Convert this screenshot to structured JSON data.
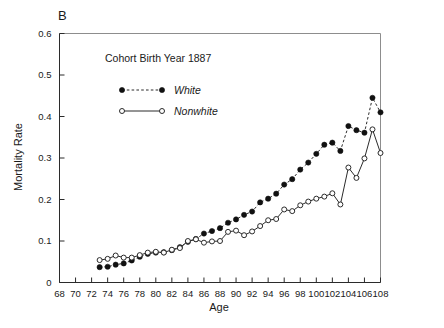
{
  "panel": {
    "label": "B"
  },
  "chart_data": {
    "type": "line",
    "title": "",
    "annotation": "Cohort Birth Year 1887",
    "xlabel": "Age",
    "ylabel": "Mortality Rate",
    "xlim": [
      68,
      108
    ],
    "ylim": [
      0,
      0.6
    ],
    "xticks": [
      68,
      70,
      72,
      74,
      76,
      78,
      80,
      82,
      84,
      86,
      88,
      90,
      92,
      94,
      96,
      98,
      100,
      102,
      104,
      106,
      108
    ],
    "xtick_labels": [
      "68",
      "70",
      "72",
      "74",
      "76",
      "78",
      "80",
      "82",
      "84",
      "86",
      "88",
      "90",
      "92",
      "94",
      "96",
      "98",
      "100",
      "102",
      "104",
      "106",
      "108"
    ],
    "yticks": [
      0,
      0.1,
      0.2,
      0.3,
      0.4,
      0.5,
      0.6
    ],
    "ytick_labels": [
      "0",
      "0.1",
      "0.2",
      "0.3",
      "0.4",
      "0.5",
      "0.6"
    ],
    "grid": false,
    "legend_position": "upper-left-inside",
    "x": [
      73,
      74,
      75,
      76,
      77,
      78,
      79,
      80,
      81,
      82,
      83,
      84,
      85,
      86,
      87,
      88,
      89,
      90,
      91,
      92,
      93,
      94,
      95,
      96,
      97,
      98,
      99,
      100,
      101,
      102,
      103,
      104,
      105,
      106,
      107,
      108
    ],
    "series": [
      {
        "name": "White",
        "marker": "filled-circle",
        "linestyle": "dashed",
        "color": "#111111",
        "values": [
          0.037,
          0.038,
          0.043,
          0.046,
          0.053,
          0.062,
          0.069,
          0.072,
          0.073,
          0.078,
          0.085,
          0.098,
          0.105,
          0.118,
          0.124,
          0.131,
          0.144,
          0.152,
          0.163,
          0.171,
          0.193,
          0.202,
          0.214,
          0.236,
          0.249,
          0.272,
          0.289,
          0.31,
          0.332,
          0.337,
          0.317,
          0.377,
          0.367,
          0.361,
          0.445,
          0.41
        ]
      },
      {
        "name": "Nonwhite",
        "marker": "open-circle",
        "linestyle": "solid",
        "color": "#2b2b2b",
        "values": [
          0.054,
          0.057,
          0.065,
          0.06,
          0.06,
          0.066,
          0.072,
          0.074,
          0.072,
          0.079,
          0.083,
          0.1,
          0.104,
          0.096,
          0.099,
          0.1,
          0.122,
          0.125,
          0.114,
          0.123,
          0.136,
          0.15,
          0.153,
          0.176,
          0.172,
          0.186,
          0.195,
          0.202,
          0.207,
          0.215,
          0.188,
          0.277,
          0.252,
          0.299,
          0.369,
          0.312
        ]
      }
    ]
  },
  "legend": {
    "entries": [
      {
        "label": "White",
        "marker": "filled-circle",
        "linestyle": "dashed"
      },
      {
        "label": "Nonwhite",
        "marker": "open-circle",
        "linestyle": "solid"
      }
    ]
  },
  "colors": {
    "axis": "#2b2b2b",
    "frame": "#8d8d8d",
    "marker_filled": "#111111",
    "marker_open_stroke": "#2b2b2b",
    "background": "#ffffff"
  }
}
